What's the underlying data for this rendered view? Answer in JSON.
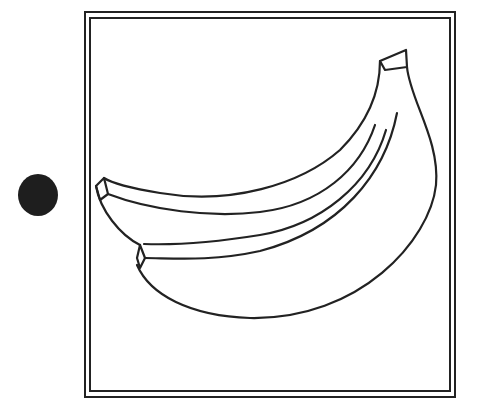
{
  "figure": {
    "marker": "filled-circle",
    "frame": "double-border",
    "colors": {
      "stroke": "#222222",
      "background": "#ffffff",
      "dot": "#1e1e1e"
    }
  }
}
